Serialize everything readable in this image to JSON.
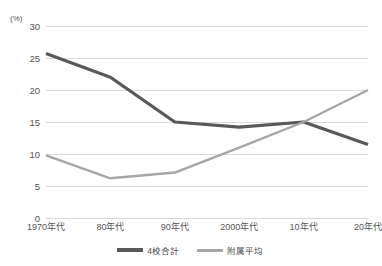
{
  "chart_data": {
    "type": "line",
    "title": "",
    "xlabel": "",
    "ylabel": "",
    "unit_label": "(%)",
    "categories": [
      "1970年代",
      "80年代",
      "90年代",
      "2000年代",
      "10年代",
      "20年代"
    ],
    "ylim": [
      0,
      30
    ],
    "ytick_step": 5,
    "yticks": [
      30,
      25,
      20,
      15,
      10,
      5,
      0
    ],
    "ytick_labels": [
      "30",
      "25",
      "20",
      "15",
      "10",
      "5",
      "0"
    ],
    "grid": "horizontal",
    "legend_position": "bottom-center",
    "series": [
      {
        "name": "4校合計",
        "color": "#595959",
        "width": 3.2,
        "values": [
          25.7,
          22.0,
          15.0,
          14.2,
          15.0,
          11.5
        ]
      },
      {
        "name": "附属平均",
        "color": "#a6a6a6",
        "width": 2.4,
        "values": [
          9.8,
          6.2,
          7.1,
          11.0,
          15.0,
          20.0
        ]
      }
    ]
  },
  "colors": {
    "background": "#ffffff",
    "gridline": "#d9d9d9",
    "axis_text": "#555555",
    "series_dark": "#595959",
    "series_light": "#a6a6a6"
  }
}
